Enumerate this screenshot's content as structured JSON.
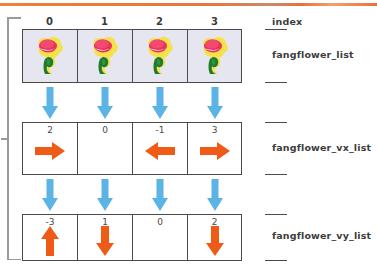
{
  "diagram": {
    "index_label": "index",
    "indices": [
      "0",
      "1",
      "2",
      "3"
    ],
    "colors": {
      "top_rule": "#e8753a",
      "cell_border": "#4a4a4a",
      "flower_cell_fill": "#e6e6f0",
      "blue_arrow": "#5bb4e5",
      "orange_arrow": "#ef5a16",
      "bracket": "#9a9a9a",
      "value_text": "#4a4a4a",
      "label_text": "#3d3d3d"
    },
    "rows": [
      {
        "name": "fangflower_list",
        "label": "fangflower_list",
        "kind": "image",
        "cells": [
          {
            "icon": "fangflower-icon"
          },
          {
            "icon": "fangflower-icon"
          },
          {
            "icon": "fangflower-icon"
          },
          {
            "icon": "fangflower-icon"
          }
        ]
      },
      {
        "name": "fangflower_vx_list",
        "label": "fangflower_vx_list",
        "kind": "value",
        "cells": [
          {
            "value": "2",
            "icon": "arrow-right-icon"
          },
          {
            "value": "0",
            "icon": "none"
          },
          {
            "value": "-1",
            "icon": "arrow-left-icon"
          },
          {
            "value": "3",
            "icon": "arrow-right-icon"
          }
        ]
      },
      {
        "name": "fangflower_vy_list",
        "label": "fangflower_vy_list",
        "kind": "value",
        "cells": [
          {
            "value": "-3",
            "icon": "arrow-up-icon"
          },
          {
            "value": "1",
            "icon": "arrow-down-icon"
          },
          {
            "value": "0",
            "icon": "none"
          },
          {
            "value": "2",
            "icon": "arrow-down-icon"
          }
        ]
      }
    ],
    "connectors": [
      {
        "name": "flower-to-vx",
        "icon": "arrow-down-icon",
        "count": 4
      },
      {
        "name": "vx-to-vy",
        "icon": "arrow-down-icon",
        "count": 4
      }
    ]
  }
}
